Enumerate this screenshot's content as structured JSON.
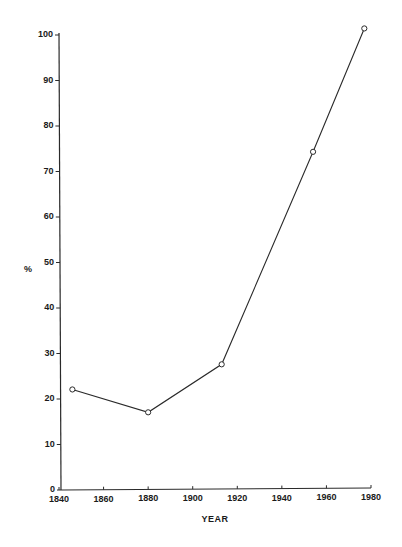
{
  "chart_data": {
    "type": "line",
    "title": "",
    "xlabel": "YEAR",
    "ylabel": "%",
    "xlim": [
      1840,
      1980
    ],
    "ylim": [
      0,
      100
    ],
    "x_ticks": [
      1840,
      1860,
      1880,
      1900,
      1920,
      1940,
      1960,
      1980
    ],
    "y_ticks": [
      0,
      10,
      20,
      30,
      40,
      50,
      60,
      70,
      80,
      90,
      100
    ],
    "grid": false,
    "legend": null,
    "marker": "open-circle",
    "series": [
      {
        "name": "%",
        "x": [
          1846,
          1880,
          1913,
          1954,
          1977
        ],
        "values": [
          22,
          17,
          27.5,
          74,
          101
        ]
      }
    ]
  },
  "style": {
    "line_color": "#2a2a2a",
    "background": "#ffffff"
  }
}
